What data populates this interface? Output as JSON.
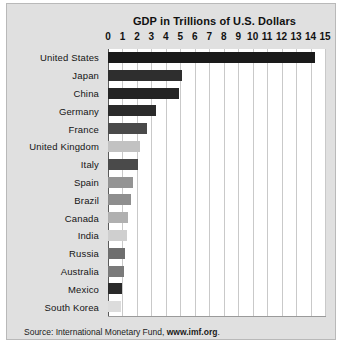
{
  "chart_data": {
    "type": "bar",
    "orientation": "horizontal",
    "title": "GDP in Trillions of U.S. Dollars",
    "xlabel": "",
    "ylabel": "",
    "xlim": [
      0,
      15
    ],
    "xticks": [
      0,
      1,
      2,
      3,
      4,
      5,
      6,
      7,
      8,
      9,
      10,
      11,
      12,
      13,
      14,
      15
    ],
    "grid": true,
    "legend": null,
    "categories": [
      "United States",
      "Japan",
      "China",
      "Germany",
      "France",
      "United Kingdom",
      "Italy",
      "Spain",
      "Brazil",
      "Canada",
      "India",
      "Russia",
      "Australia",
      "Mexico",
      "South Korea"
    ],
    "values": [
      14.3,
      5.1,
      4.9,
      3.3,
      2.7,
      2.2,
      2.1,
      1.7,
      1.6,
      1.4,
      1.3,
      1.2,
      1.1,
      1.0,
      0.9
    ],
    "bar_colors": [
      "#1a1a1a",
      "#2e2e2e",
      "#242424",
      "#2b2b2b",
      "#4a4a4a",
      "#c2c2c2",
      "#4a4a4a",
      "#949494",
      "#8e8e8e",
      "#b0b0b0",
      "#cfcfcf",
      "#6e6e6e",
      "#7a7a7a",
      "#2a2a2a",
      "#dcdcdc"
    ]
  },
  "source": {
    "prefix": "Source: International Monetary Fund, ",
    "link": "www.imf.org",
    "suffix": "."
  },
  "colors": {
    "panel_background": "#e0e0e0",
    "plot_background": "#ffffff",
    "gridline": "#c9c9c9",
    "axis": "#5a5a5a",
    "text": "#111111"
  }
}
